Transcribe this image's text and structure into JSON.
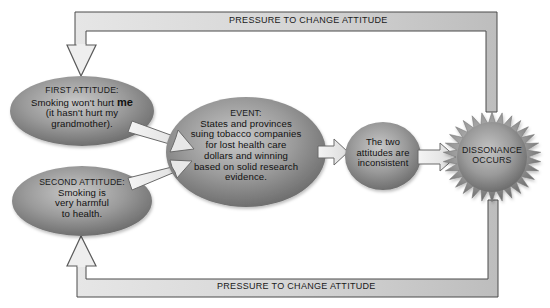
{
  "diagram": {
    "type": "cognitive-dissonance-flow",
    "feedback_loops": {
      "top_label": "PRESSURE TO CHANGE ATTITUDE",
      "bottom_label": "PRESSURE TO CHANGE ATTITUDE"
    },
    "nodes": {
      "first_attitude": {
        "heading": "FIRST ATTITUDE:",
        "line1_prefix": "Smoking won't hurt ",
        "line1_emphasis": "me",
        "line2": "(it hasn't hurt my",
        "line3": "grandmother)."
      },
      "second_attitude": {
        "heading": "SECOND ATTITUDE:",
        "line1": "Smoking is",
        "line2": "very harmful",
        "line3": "to health."
      },
      "event": {
        "heading": "EVENT:",
        "line1": "States and provinces",
        "line2": "suing tobacco companies",
        "line3": "for lost health care",
        "line4": "dollars and winning",
        "line5": "based on solid research",
        "line6": "evidence."
      },
      "inconsistent": {
        "line1": "The two",
        "line2": "attitudes are",
        "line3": "inconsistent"
      },
      "dissonance": {
        "line1": "DISSONANCE",
        "line2": "OCCURS"
      }
    },
    "colors": {
      "node_fill": "#8f8f8f",
      "node_highlight": "#c4c4c4",
      "node_shadow": "#5e5e5e",
      "arrow_fill": "#eeeeee",
      "arrow_stroke": "#6a6a6a",
      "bar_fill": "#cfcfcf",
      "bar_stroke": "#4a4a4a"
    }
  }
}
